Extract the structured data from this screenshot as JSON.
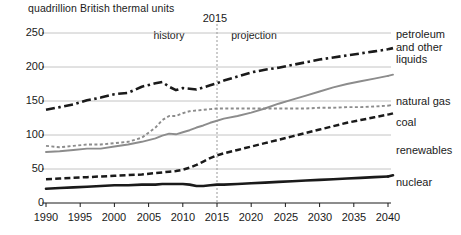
{
  "chart": {
    "unit_label": "quadrillion British thermal units",
    "divider_year": "2015",
    "phase_history": "history",
    "phase_projection": "projection",
    "y_ticks": [
      "0",
      "50",
      "100",
      "150",
      "200",
      "250"
    ],
    "x_ticks": [
      "1990",
      "1995",
      "2000",
      "2005",
      "2010",
      "2015",
      "2020",
      "2025",
      "2030",
      "2035",
      "2040"
    ],
    "labels": {
      "petroleum_line1": "petroleum",
      "petroleum_line2": "and other",
      "petroleum_line3": "liquids",
      "natural_gas": "natural gas",
      "coal": "coal",
      "renewables": "renewables",
      "nuclear": "nuclear"
    },
    "colors": {
      "black": "#1a1a1a",
      "gray": "#8c8c8c",
      "gridline": "#b5b5b5",
      "divider": "#999999",
      "background": "#ffffff"
    }
  },
  "chart_data": {
    "type": "line",
    "title": "",
    "subtitle": "",
    "xlabel": "",
    "ylabel": "quadrillion British thermal units",
    "xlim": [
      1990,
      2040
    ],
    "ylim": [
      0,
      250
    ],
    "grid": true,
    "legend_position": "right-inline",
    "annotations": [
      {
        "text": "2015",
        "x": 2015,
        "type": "vertical-divider"
      },
      {
        "text": "history",
        "x": 2006,
        "type": "region-label"
      },
      {
        "text": "projection",
        "x": 2024,
        "type": "region-label"
      }
    ],
    "x": [
      1990,
      1992,
      1994,
      1996,
      1998,
      2000,
      2002,
      2004,
      2006,
      2007,
      2008,
      2009,
      2010,
      2011,
      2012,
      2013,
      2014,
      2015,
      2016,
      2018,
      2020,
      2022,
      2024,
      2026,
      2028,
      2030,
      2032,
      2034,
      2036,
      2038,
      2040
    ],
    "series": [
      {
        "name": "petroleum and other liquids",
        "style": "dash-dot",
        "color": "#1a1a1a",
        "values": [
          137,
          141,
          145,
          151,
          155,
          160,
          162,
          171,
          176,
          178,
          171,
          166,
          169,
          168,
          167,
          170,
          173,
          176,
          180,
          186,
          192,
          196,
          199,
          203,
          207,
          211,
          214,
          217,
          220,
          223,
          226
        ]
      },
      {
        "name": "natural gas",
        "style": "solid",
        "color": "#8c8c8c",
        "values": [
          75,
          76,
          78,
          80,
          80,
          83,
          86,
          90,
          95,
          99,
          102,
          101,
          104,
          107,
          111,
          114,
          118,
          121,
          124,
          128,
          133,
          139,
          146,
          152,
          158,
          164,
          170,
          175,
          179,
          183,
          187
        ]
      },
      {
        "name": "coal",
        "style": "dotted-gray",
        "color": "#8c8c8c",
        "values": [
          84,
          82,
          84,
          86,
          86,
          88,
          90,
          96,
          111,
          122,
          128,
          128,
          132,
          135,
          136,
          137,
          138,
          139,
          139,
          139,
          139,
          139,
          139,
          139,
          139,
          140,
          140,
          141,
          141,
          142,
          143
        ]
      },
      {
        "name": "renewables",
        "style": "dashed",
        "color": "#1a1a1a",
        "values": [
          35,
          36,
          37,
          38,
          39,
          40,
          41,
          42,
          44,
          45,
          46,
          47,
          49,
          52,
          56,
          61,
          66,
          70,
          73,
          78,
          83,
          88,
          93,
          98,
          103,
          108,
          113,
          118,
          122,
          126,
          130
        ]
      },
      {
        "name": "nuclear",
        "style": "solid-thick",
        "color": "#1a1a1a",
        "values": [
          21,
          22,
          23,
          24,
          25,
          26,
          26,
          27,
          27,
          28,
          28,
          28,
          28,
          27,
          25,
          25,
          26,
          27,
          27,
          28,
          29,
          30,
          31,
          32,
          33,
          34,
          35,
          36,
          37,
          38,
          39
        ]
      }
    ]
  }
}
